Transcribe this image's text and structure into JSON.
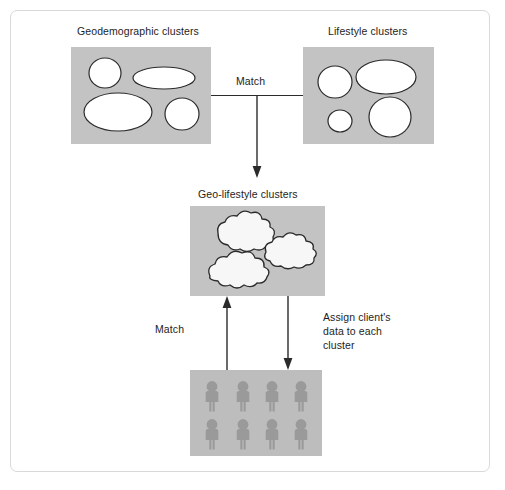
{
  "diagram": {
    "title_hidden": "",
    "boxes": {
      "geodemographic": {
        "label": "Geodemographic clusters",
        "fill": "#c3c3c3",
        "shape_outline": "#2b2b2b",
        "shape_fill": "#ffffff",
        "shape_count": 4,
        "shape_type": "ellipse"
      },
      "lifestyle": {
        "label": "Lifestyle clusters",
        "fill": "#c3c3c3",
        "shape_outline": "#2b2b2b",
        "shape_fill": "#ffffff",
        "shape_count": 4,
        "shape_type": "ellipse"
      },
      "geolifestyle": {
        "label": "Geo-lifestyle clusters",
        "fill": "#c3c3c3",
        "shape_outline": "#2b2b2b",
        "shape_fill": "#f7f7f7",
        "shape_count": 3,
        "shape_type": "cloud"
      },
      "clientdata": {
        "label": "",
        "fill": "#bdbdbd",
        "icon_fill": "#9a9a9a",
        "icon_name": "person-icon",
        "rows": 2,
        "columns": 4,
        "person_count": 8
      }
    },
    "connectors": {
      "match_top": "Match",
      "match_bottom": "Match",
      "assign": "Assign client's\ndata to each\ncluster"
    },
    "colors": {
      "frame_border": "#d9d9d9",
      "line": "#2b2b2b",
      "text": "#1d1d1d",
      "box_gray": "#c3c3c3",
      "people_gray": "#bdbdbd",
      "person_gray": "#9a9a9a"
    }
  }
}
